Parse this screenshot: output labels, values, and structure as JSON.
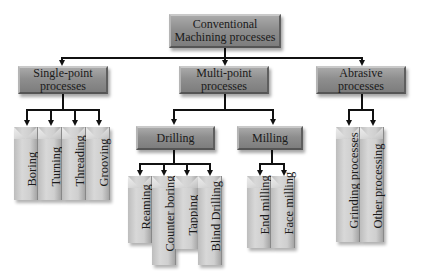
{
  "diagram": {
    "root": {
      "label": "Conventional\nMachining processes"
    },
    "categories": [
      {
        "label": "Single-point\nprocesses",
        "children": [
          "Boring",
          "Turning",
          "Threading",
          "Grooving"
        ]
      },
      {
        "label": "Multi-point\nprocesses",
        "subcategories": [
          {
            "label": "Drilling",
            "children": [
              "Reaming",
              "Counter boring",
              "Tapping",
              "Blind Drilling"
            ]
          },
          {
            "label": "Milling",
            "children": [
              "End milling",
              "Face milling"
            ]
          }
        ]
      },
      {
        "label": "Abrasive\nprocesses",
        "children": [
          "Grinding processes",
          "Other processing"
        ]
      }
    ]
  },
  "colors": {
    "node_fill": "#8e8e8e",
    "leaf_fill": "#d0d0d0",
    "connector": "#111111"
  }
}
